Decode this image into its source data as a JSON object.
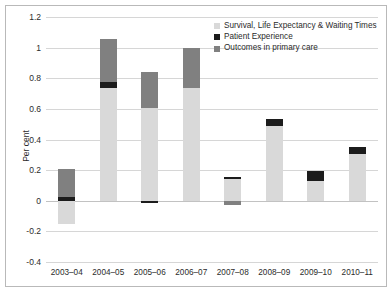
{
  "chart_data": {
    "type": "bar",
    "stacked": true,
    "title": "",
    "xlabel": "",
    "ylabel": "Per cent",
    "ylim": [
      -0.4,
      1.2
    ],
    "yticks": [
      1.2,
      1,
      0.8,
      0.6,
      0.4,
      0.2,
      0,
      -0.2,
      -0.4
    ],
    "ytick_labels": [
      "1.2",
      "1",
      "0.8",
      "0.6",
      "0.4",
      "0.2",
      "0",
      "-0.2",
      "-0.4"
    ],
    "grid": true,
    "legend_position": "top-right",
    "categories": [
      "2003–04",
      "2004–05",
      "2005–06",
      "2006–07",
      "2007–08",
      "2008–09",
      "2009–10",
      "2010–11"
    ],
    "series": [
      {
        "name": "Survival, Life Expectancy & Waiting Times",
        "color": "#d9d9d9",
        "values": [
          -0.15,
          0.735,
          0.605,
          0.735,
          0.145,
          0.49,
          0.13,
          0.305
        ]
      },
      {
        "name": "Patient Experience",
        "color": "#1c1c1c",
        "values": [
          0.025,
          0.04,
          -0.015,
          0.0,
          0.01,
          0.045,
          0.065,
          0.045
        ]
      },
      {
        "name": "Outcomes in primary care",
        "color": "#808080",
        "values": [
          0.18,
          0.28,
          0.235,
          0.265,
          -0.025,
          0.0,
          0.0,
          0.0
        ]
      }
    ],
    "bar_totals": [
      0.205,
      1.055,
      0.84,
      1.0,
      0.155,
      0.535,
      0.195,
      0.35
    ]
  },
  "legend": {
    "items": [
      {
        "label": "Survival, Life Expectancy & Waiting Times",
        "color": "#d9d9d9"
      },
      {
        "label": "Patient Experience",
        "color": "#1c1c1c"
      },
      {
        "label": "Outcomes in primary care",
        "color": "#808080"
      }
    ]
  },
  "axes": {
    "y_title": "Per cent"
  }
}
